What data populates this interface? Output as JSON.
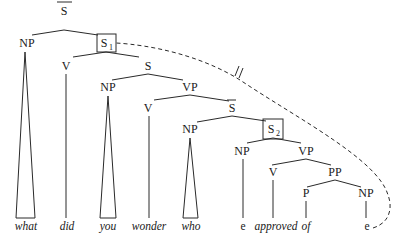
{
  "diagram": {
    "type": "syntax-tree",
    "nodes": {
      "sbar_top": "S",
      "np_what": "NP",
      "s1": "S",
      "s1_sub": "1",
      "v_did": "V",
      "s_mid": "S",
      "np_you": "NP",
      "vp_wonder": "VP",
      "v_wonder": "V",
      "sbar_inner": "S",
      "np_who": "NP",
      "s2": "S",
      "s2_sub": "2",
      "np_e": "NP",
      "vp_approved": "VP",
      "v_approved": "V",
      "pp_of": "PP",
      "p_of": "P",
      "np_gap": "NP"
    },
    "words": {
      "what": "what",
      "did": "did",
      "you": "you",
      "wonder": "wonder",
      "who": "who",
      "e1": "e",
      "approved": "approved",
      "of": "of",
      "e2": "e"
    },
    "annotations": {
      "blocked_link_mark": "//"
    }
  }
}
